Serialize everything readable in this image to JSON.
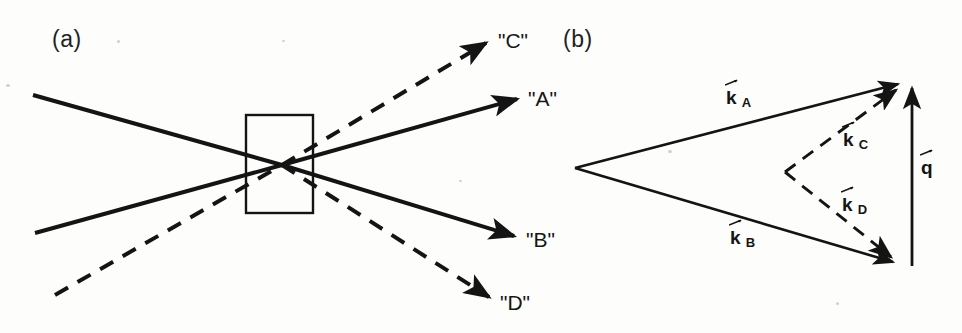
{
  "figure": {
    "width": 962,
    "height": 333,
    "background": "#fdfdfc",
    "ink": "#141414"
  },
  "panel_a": {
    "label": "(a)",
    "label_x": 52,
    "label_y": 26,
    "sample_box": {
      "x": 246,
      "y": 115,
      "width": 67,
      "height": 98
    },
    "crossing_point": {
      "x": 282,
      "y": 165
    },
    "input_beams": [
      {
        "name": "input-solid-upper",
        "style": "solid",
        "x1": 33,
        "y1": 95,
        "x2": 282,
        "y2": 165
      },
      {
        "name": "input-solid-lower",
        "style": "solid",
        "x1": 35,
        "y1": 233,
        "x2": 282,
        "y2": 165
      },
      {
        "name": "input-dashed",
        "style": "dashed",
        "x1": 55,
        "y1": 295,
        "x2": 282,
        "y2": 165
      }
    ],
    "output_beams": [
      {
        "name": "beam-C",
        "style": "dashed",
        "label": "\"C\"",
        "x1": 282,
        "y1": 165,
        "x2": 490,
        "y2": 40,
        "label_x": 498,
        "label_y": 29
      },
      {
        "name": "beam-A",
        "style": "solid",
        "label": "\"A\"",
        "x1": 282,
        "y1": 165,
        "x2": 521,
        "y2": 98,
        "label_x": 528,
        "label_y": 87
      },
      {
        "name": "beam-B",
        "style": "solid",
        "label": "\"B\"",
        "x1": 282,
        "y1": 165,
        "x2": 518,
        "y2": 238,
        "label_x": 526,
        "label_y": 228
      },
      {
        "name": "beam-D",
        "style": "dashed",
        "label": "\"D\"",
        "x1": 282,
        "y1": 165,
        "x2": 493,
        "y2": 301,
        "label_x": 500,
        "label_y": 291
      }
    ]
  },
  "panel_b": {
    "label": "(b)",
    "label_x": 563,
    "label_y": 26,
    "apex": {
      "x": 575,
      "y": 168
    },
    "vertex_top": {
      "x": 905,
      "y": 82
    },
    "vertex_bottom": {
      "x": 900,
      "y": 265
    },
    "dashed_apex": {
      "x": 785,
      "y": 172
    },
    "q_vector": {
      "x1": 912,
      "y1": 266,
      "x2": 912,
      "y2": 80
    },
    "vectors": [
      {
        "name": "vector-kA",
        "style": "solid",
        "symbol": "k",
        "subscript": "A",
        "x1": 575,
        "y1": 168,
        "x2": 905,
        "y2": 82,
        "label_x": 726,
        "label_y": 88
      },
      {
        "name": "vector-kB",
        "style": "solid",
        "symbol": "k",
        "subscript": "B",
        "x1": 575,
        "y1": 168,
        "x2": 900,
        "y2": 265,
        "label_x": 730,
        "label_y": 228
      },
      {
        "name": "vector-kC",
        "style": "dashed",
        "symbol": "k",
        "subscript": "C",
        "x1": 785,
        "y1": 172,
        "x2": 903,
        "y2": 85,
        "label_x": 843,
        "label_y": 130
      },
      {
        "name": "vector-kD",
        "style": "dashed",
        "symbol": "k",
        "subscript": "D",
        "x1": 785,
        "y1": 172,
        "x2": 898,
        "y2": 263,
        "label_x": 842,
        "label_y": 195
      },
      {
        "name": "vector-q",
        "style": "solid",
        "symbol": "q",
        "subscript": "",
        "x1": 912,
        "y1": 266,
        "x2": 912,
        "y2": 80,
        "label_x": 921,
        "label_y": 158
      }
    ]
  },
  "stroke": {
    "solid_width": 4.0,
    "dashed_width": 4.0,
    "box_width": 2.4,
    "thin_width": 2.6,
    "dash_pattern": "15 11"
  }
}
